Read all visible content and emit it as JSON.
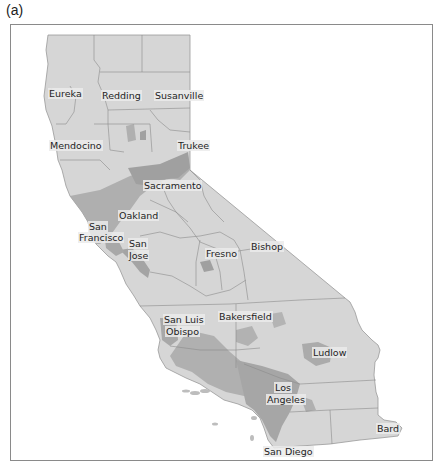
{
  "figure": {
    "panel_label": "(a)",
    "colors": {
      "land": "#d6d6d6",
      "urban": "#a8a8a8",
      "urban_dark": "#9a9a9a",
      "county_line": "#8c8c8c",
      "frame": "#8a8a8a",
      "water": "#ffffff"
    }
  },
  "map": {
    "region": "California",
    "cities": [
      {
        "name": "Eureka",
        "x": 48,
        "y": 94
      },
      {
        "name": "Redding",
        "x": 101,
        "y": 96
      },
      {
        "name": "Susanville",
        "x": 154,
        "y": 96
      },
      {
        "name": "Mendocino",
        "x": 49,
        "y": 146
      },
      {
        "name": "Trukee",
        "x": 177,
        "y": 146
      },
      {
        "name": "Sacramento",
        "x": 143,
        "y": 186
      },
      {
        "name": "Oakland",
        "x": 118,
        "y": 216
      },
      {
        "name": "San",
        "x": 88,
        "y": 227
      },
      {
        "name": "Francisco",
        "x": 78,
        "y": 238
      },
      {
        "name": "San",
        "x": 128,
        "y": 244
      },
      {
        "name": "Jose",
        "x": 128,
        "y": 256
      },
      {
        "name": "Fresno",
        "x": 205,
        "y": 254
      },
      {
        "name": "Bishop",
        "x": 250,
        "y": 247
      },
      {
        "name": "Bakersfield",
        "x": 218,
        "y": 317
      },
      {
        "name": "San Luis",
        "x": 163,
        "y": 320
      },
      {
        "name": "Obispo",
        "x": 165,
        "y": 332
      },
      {
        "name": "Ludlow",
        "x": 312,
        "y": 353
      },
      {
        "name": "Los",
        "x": 274,
        "y": 388
      },
      {
        "name": "Angeles",
        "x": 266,
        "y": 400
      },
      {
        "name": "Bard",
        "x": 376,
        "y": 429
      },
      {
        "name": "San Diego",
        "x": 263,
        "y": 452
      }
    ]
  }
}
